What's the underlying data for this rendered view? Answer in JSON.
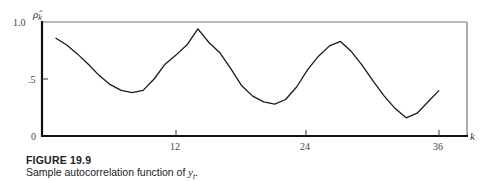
{
  "chart_data": {
    "type": "line",
    "title": "FIGURE 19.9",
    "subtitle": "Sample autocorrelation function of y_t.",
    "xlabel": "k",
    "ylabel": "ρ̂_k",
    "xlim": [
      0,
      38
    ],
    "ylim": [
      0,
      1.0
    ],
    "x_ticks": [
      12,
      24,
      36
    ],
    "y_ticks": [
      {
        "value": 0,
        "label": "0"
      },
      {
        "value": 0.5,
        "label": ".5"
      },
      {
        "value": 1.0,
        "label": "1.0"
      }
    ],
    "grid": false,
    "legend": null,
    "series": [
      {
        "name": "sample autocorrelation",
        "x": [
          1,
          2,
          3,
          4,
          5,
          6,
          7,
          8,
          9,
          10,
          11,
          12,
          13,
          14,
          15,
          16,
          17,
          18,
          19,
          20,
          21,
          22,
          23,
          24,
          25,
          26,
          27,
          28,
          29,
          30,
          31,
          32,
          33,
          34,
          35,
          36
        ],
        "values": [
          0.86,
          0.8,
          0.72,
          0.63,
          0.53,
          0.45,
          0.4,
          0.38,
          0.4,
          0.5,
          0.63,
          0.71,
          0.8,
          0.94,
          0.82,
          0.73,
          0.59,
          0.44,
          0.35,
          0.3,
          0.28,
          0.32,
          0.43,
          0.58,
          0.7,
          0.79,
          0.83,
          0.74,
          0.62,
          0.48,
          0.35,
          0.24,
          0.16,
          0.2,
          0.3,
          0.4
        ]
      }
    ]
  },
  "caption": {
    "figure_label": "FIGURE 19.9",
    "text_prefix": "Sample autocorrelation function of ",
    "text_var": "y",
    "text_sub": "t",
    "text_suffix": "."
  },
  "axes": {
    "y_symbol": "ρ̂",
    "y_symbol_sub": "k",
    "x_symbol": "k",
    "y_tick_top": "1.0",
    "y_tick_mid": ".5",
    "y_tick_zero": "0",
    "x_tick_12": "12",
    "x_tick_24": "24",
    "x_tick_36": "36"
  },
  "colors": {
    "line": "#1a1a1a",
    "axis": "#111111",
    "frame": "#777777",
    "background": "#ffffff"
  }
}
